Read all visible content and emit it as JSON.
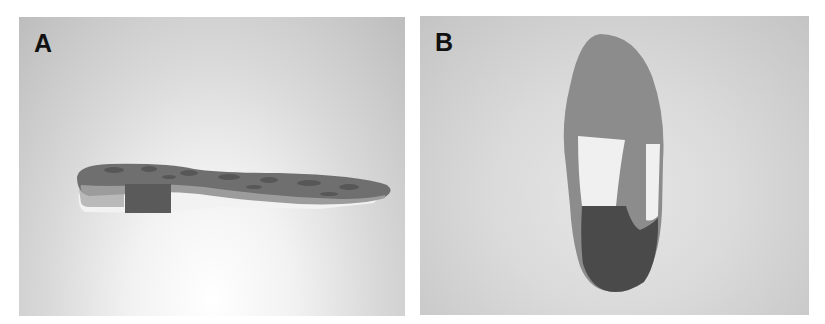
{
  "figure": {
    "panels": [
      {
        "label": "A",
        "description": "Side view of insole with heel wedge",
        "background": "#d8d8d8"
      },
      {
        "label": "B",
        "description": "Bottom view of insole with forefoot and heel padding",
        "background": "#d4d4d4"
      }
    ],
    "colors": {
      "insole_top": "#6e6e6e",
      "insole_side": "#9a9a9a",
      "wedge": "#5a5a5a",
      "white_layer": "#f4f4f4",
      "forefoot": "#8a8a8a",
      "heel": "#4a4a4a"
    }
  }
}
